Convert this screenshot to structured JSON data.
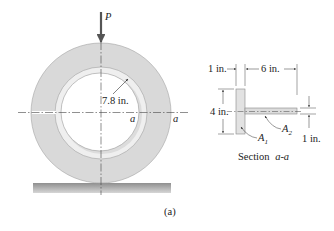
{
  "figure": {
    "caption": "(a)",
    "colors": {
      "ring_fill": "#d9d9d9",
      "ring_edge": "#9a9a9a",
      "band_fill": "#efefef",
      "hole_fill": "#ffffff",
      "ground_fill": "#b5b5b5",
      "line": "#333333",
      "section_fill": "#e2e2e2"
    }
  },
  "ring_view": {
    "load_label": "P",
    "radius_label": "7.8 in.",
    "section_mark_left": "a",
    "section_mark_right": "a"
  },
  "section_view": {
    "title_prefix": "Section ",
    "title_ref": "a-a",
    "dims": {
      "flange_width": "1 in.",
      "web_length": "6 in.",
      "flange_height": "4 in.",
      "web_thickness": "1 in."
    },
    "areas": {
      "a1": {
        "main": "A",
        "sub": "1"
      },
      "a2": {
        "main": "A",
        "sub": "2"
      }
    }
  }
}
